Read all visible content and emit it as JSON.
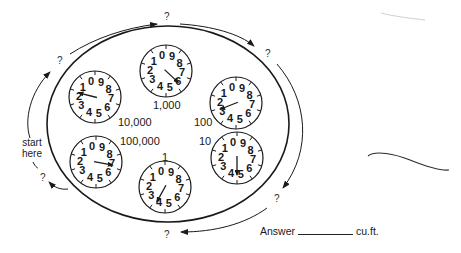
{
  "diagram": {
    "instructions": {
      "start_label": "start here"
    },
    "question_marks": [
      {
        "id": "q-top",
        "text": "?",
        "x": 168,
        "y": 11
      },
      {
        "id": "q-topleft",
        "text": "?",
        "x": 56,
        "y": 58
      },
      {
        "id": "q-topright",
        "text": "?",
        "x": 265,
        "y": 48
      },
      {
        "id": "q-bottomright",
        "text": "?",
        "x": 273,
        "y": 195
      },
      {
        "id": "q-bottom",
        "text": "?",
        "x": 164,
        "y": 229
      },
      {
        "id": "q-left",
        "text": "?",
        "x": 38,
        "y": 174
      }
    ],
    "dials": [
      {
        "id": "dial-10000",
        "label": "10,000",
        "cx": 95,
        "cy": 97,
        "hand_digit": 2.1,
        "label_x": 118,
        "label_y": 116
      },
      {
        "id": "dial-1000",
        "label": "1,000",
        "cx": 166,
        "cy": 71,
        "hand_digit": 6.3,
        "label_x": 153,
        "label_y": 99
      },
      {
        "id": "dial-100",
        "label": "100",
        "cx": 236,
        "cy": 103,
        "hand_digit": 3.1,
        "label_x": 194,
        "label_y": 116
      },
      {
        "id": "dial-10",
        "label": "10",
        "cx": 237,
        "cy": 158,
        "hand_digit": 5.0,
        "label_x": 199,
        "label_y": 135
      },
      {
        "id": "dial-1",
        "label": "1",
        "cx": 165,
        "cy": 187,
        "hand_digit": 4.2,
        "label_x": 162,
        "label_y": 152
      },
      {
        "id": "dial-100000",
        "label": "100,000",
        "cx": 96,
        "cy": 162,
        "hand_digit": 7.2,
        "label_x": 120,
        "label_y": 135
      }
    ],
    "dial_digits": [
      "0",
      "9",
      "8",
      "7",
      "6",
      "5",
      "4",
      "3",
      "2",
      "1"
    ],
    "answer": {
      "label": "Answer",
      "value": "",
      "unit": "cu.ft."
    },
    "colors": {
      "ink": "#1a1a1a",
      "paper": "#ffffff"
    }
  }
}
